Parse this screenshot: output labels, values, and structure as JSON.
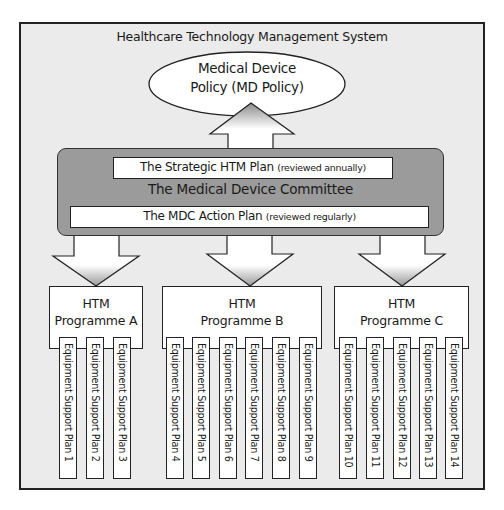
{
  "diagram": {
    "system_title": "Healthcare Technology Management System",
    "policy": {
      "line1": "Medical Device",
      "line2": "Policy (MD Policy)"
    },
    "committee": {
      "label": "The Medical Device Committee",
      "strategic_plan": {
        "label": "The Strategic HTM Plan",
        "note": "(reviewed annually)"
      },
      "action_plan": {
        "label": "The MDC Action Plan",
        "note": "(reviewed regularly)"
      }
    },
    "programmes": [
      {
        "line1": "HTM",
        "line2": "Programme A"
      },
      {
        "line1": "HTM",
        "line2": "Programme B"
      },
      {
        "line1": "HTM",
        "line2": "Programme C"
      }
    ],
    "support_plans": [
      "Equipment Support Plan 1",
      "Equipment Support Plan 2",
      "Equipment Support Plan 3",
      "Equipment Support Plan 4",
      "Equipment Support Plan 5",
      "Equipment Support Plan 6",
      "Equipment Support Plan 7",
      "Equipment Support Plan 8",
      "Equipment Support Plan 9",
      "Equipment Support Plan 10",
      "Equipment Support Plan 11",
      "Equipment Support Plan 12",
      "Equipment Support Plan 13",
      "Equipment Support Plan 14"
    ],
    "colors": {
      "background": "#ebebeb",
      "committee_fill": "#9b9b9b",
      "box_fill": "#ffffff",
      "outline": "#222222",
      "arrow_gradient_dark": "#8a8a8a"
    }
  }
}
